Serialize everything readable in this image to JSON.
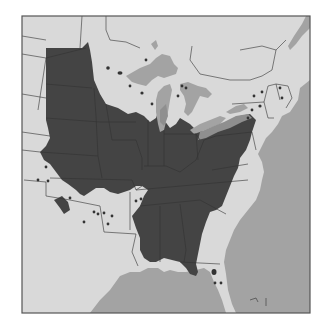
{
  "map": {
    "title": "Species range map, eastern and central United States",
    "region": "Eastern and Central United States",
    "legend": {
      "range_color": "#444444",
      "fringe_color": "#8f8f8f",
      "land_color": "#d9d9d9",
      "water_color": "#a3a3a3",
      "outside_color": "#ffffff"
    },
    "features": {
      "main_range": "Contiguous range across Great Plains, Midwest, Ohio Valley and Southeast",
      "disjunct_populations": "Scattered dots in Minnesota, Wisconsin, Michigan, New York, New England, Kansas, Oklahoma, Arkansas, Florida",
      "great_lakes": [
        "Superior",
        "Michigan",
        "Huron",
        "Erie",
        "Ontario"
      ],
      "bodies_of_water": [
        "Atlantic Ocean",
        "Gulf of Mexico"
      ]
    }
  }
}
